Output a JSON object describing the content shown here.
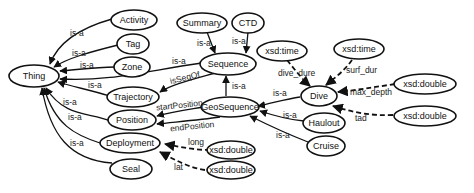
{
  "diagram": {
    "type": "ontology-graph",
    "nodes": {
      "thing": "Thing",
      "activity": "Activity",
      "tag": "Tag",
      "zone": "Zone",
      "trajectory": "Trajectory",
      "position": "Position",
      "deployment": "Deployment",
      "seal": "Seal",
      "summary": "Summary",
      "ctd": "CTD",
      "sequence": "Sequence",
      "geosequence": "GeoSequence",
      "dive": "Dive",
      "haulout": "Haulout",
      "cruise": "Cruise",
      "xsd_time_1": "xsd:time",
      "xsd_time_2": "xsd:time",
      "xsd_double_maxdepth": "xsd:double",
      "xsd_double_tad": "xsd:double",
      "xsd_double_long": "xsd:double",
      "xsd_double_lat": "xsd:double"
    },
    "edges": {
      "activity_thing": "is-a",
      "tag_thing": "is-a",
      "zone_thing": "is-a",
      "sequence_thing": "is-a",
      "trajectory_thing": "is-a",
      "position_thing": "is-a",
      "deployment_thing": "is-a",
      "seal_thing": "is-a",
      "summary_sequence": "is-a",
      "ctd_sequence": "is-a",
      "trajectory_sequence": "isSeqOf",
      "geosequence_sequence": "is-a",
      "geosequence_startposition": "startPosition",
      "geosequence_endposition": "endPosition",
      "dive_geosequence": "is-a",
      "haulout_geosequence": "is-a",
      "cruise_geosequence": "is-a",
      "dive_dur": "dive_dure",
      "surf_dur": "surf_dur",
      "max_depth": "max_depth",
      "tad": "tad",
      "long": "long",
      "lat": "lat"
    }
  }
}
